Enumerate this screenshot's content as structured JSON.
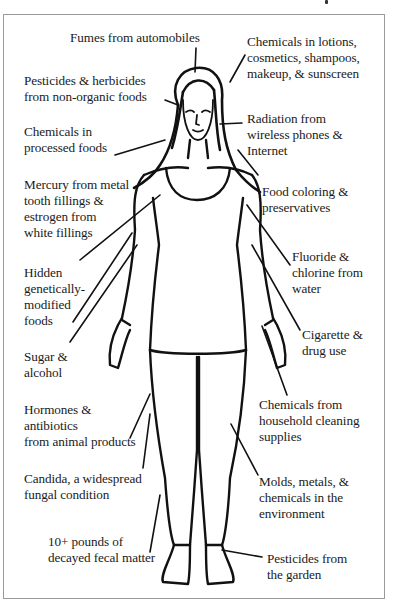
{
  "diagram": {
    "line_color": "#111111",
    "frame_color": "#9a9a9a",
    "labels": [
      {
        "id": "fumes",
        "lines": [
          "Fumes from automobiles"
        ]
      },
      {
        "id": "pesticides-herbicides",
        "lines": [
          "Pesticides & herbicides",
          "from non-organic foods"
        ]
      },
      {
        "id": "processed-foods",
        "lines": [
          "Chemicals in",
          "processed foods"
        ]
      },
      {
        "id": "mercury",
        "lines": [
          "Mercury from metal",
          "tooth fillings &",
          "estrogen from",
          "white fillings"
        ]
      },
      {
        "id": "gmo",
        "lines": [
          "Hidden",
          "genetically-",
          "modified",
          "foods"
        ]
      },
      {
        "id": "sugar",
        "lines": [
          "Sugar &",
          "alcohol"
        ]
      },
      {
        "id": "hormones",
        "lines": [
          "Hormones &",
          "antibiotics",
          "from animal products"
        ]
      },
      {
        "id": "candida",
        "lines": [
          "Candida, a widespread",
          "fungal condition"
        ]
      },
      {
        "id": "fecal",
        "lines": [
          "10+ pounds of",
          "decayed fecal matter"
        ]
      },
      {
        "id": "lotions",
        "lines": [
          "Chemicals in lotions,",
          "cosmetics, shampoos,",
          "makeup, & sunscreen"
        ]
      },
      {
        "id": "radiation",
        "lines": [
          "Radiation from",
          "wireless phones &",
          "Internet"
        ]
      },
      {
        "id": "food-coloring",
        "lines": [
          "Food coloring &",
          "preservatives"
        ]
      },
      {
        "id": "fluoride",
        "lines": [
          "Fluoride &",
          "chlorine from",
          "water"
        ]
      },
      {
        "id": "cigarette",
        "lines": [
          "Cigarette &",
          "drug use"
        ]
      },
      {
        "id": "household",
        "lines": [
          "Chemicals from",
          "household cleaning",
          "supplies"
        ]
      },
      {
        "id": "molds",
        "lines": [
          "Molds, metals, &",
          "chemicals in the",
          "environment"
        ]
      },
      {
        "id": "garden",
        "lines": [
          "Pesticides from",
          "the garden"
        ]
      }
    ]
  }
}
